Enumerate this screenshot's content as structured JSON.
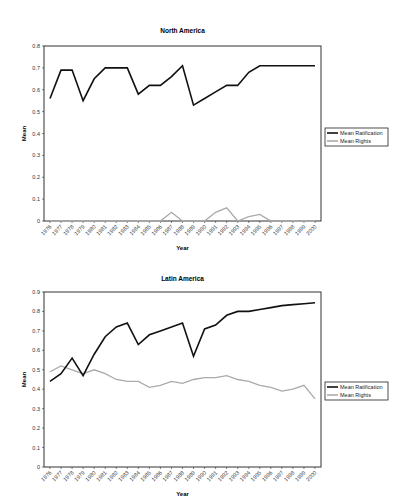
{
  "chart_data": [
    {
      "type": "line",
      "title": "North America",
      "xlabel": "Year",
      "ylabel": "Mean",
      "ylim": [
        0,
        0.8
      ],
      "yticks": [
        0,
        0.1,
        0.2,
        0.3,
        0.4,
        0.5,
        0.6,
        0.7,
        0.8
      ],
      "grid": false,
      "legend_position": "right",
      "x": [
        "1976",
        "1977",
        "1978",
        "1979",
        "1980",
        "1981",
        "1982",
        "1983",
        "1984",
        "1985",
        "1986",
        "1987",
        "1988",
        "1989",
        "1990",
        "1991",
        "1992",
        "1993",
        "1994",
        "1995",
        "1996",
        "1997",
        "1998",
        "1999",
        "2000"
      ],
      "series": [
        {
          "name": "Mean Ratification",
          "color": "#111111",
          "values": [
            0.56,
            0.69,
            0.69,
            0.55,
            0.65,
            0.7,
            0.7,
            0.7,
            0.58,
            0.62,
            0.62,
            0.66,
            0.71,
            0.53,
            0.56,
            0.59,
            0.62,
            0.62,
            0.68,
            0.71,
            0.71,
            0.71,
            0.71,
            0.71,
            0.71
          ]
        },
        {
          "name": "Mean Rights",
          "color": "#aaaaaa",
          "values": [
            0,
            0,
            0,
            0,
            0,
            0,
            0,
            0,
            0,
            0,
            0,
            0.04,
            0,
            0,
            0,
            0.04,
            0.06,
            0,
            0.02,
            0.03,
            0,
            0,
            0,
            0,
            0
          ]
        }
      ]
    },
    {
      "type": "line",
      "title": "Latin America",
      "xlabel": "Year",
      "ylabel": "Mean",
      "ylim": [
        0,
        0.9
      ],
      "yticks": [
        0,
        0.1,
        0.2,
        0.3,
        0.4,
        0.5,
        0.6,
        0.7,
        0.8,
        0.9
      ],
      "grid": false,
      "legend_position": "right",
      "x": [
        "1976",
        "1977",
        "1978",
        "1979",
        "1980",
        "1981",
        "1982",
        "1983",
        "1984",
        "1985",
        "1986",
        "1987",
        "1988",
        "1989",
        "1990",
        "1991",
        "1992",
        "1993",
        "1994",
        "1995",
        "1996",
        "1997",
        "1998",
        "1999",
        "2000"
      ],
      "series": [
        {
          "name": "Mean Ratification",
          "color": "#111111",
          "values": [
            0.44,
            0.48,
            0.56,
            0.47,
            0.58,
            0.67,
            0.72,
            0.74,
            0.63,
            0.68,
            0.7,
            0.72,
            0.74,
            0.57,
            0.71,
            0.73,
            0.78,
            0.8,
            0.8,
            0.81,
            0.82,
            0.83,
            0.835,
            0.84,
            0.845
          ]
        },
        {
          "name": "Mean Rights",
          "color": "#aaaaaa",
          "values": [
            0.49,
            0.52,
            0.5,
            0.48,
            0.5,
            0.48,
            0.45,
            0.44,
            0.44,
            0.41,
            0.42,
            0.44,
            0.43,
            0.45,
            0.46,
            0.46,
            0.47,
            0.45,
            0.44,
            0.42,
            0.41,
            0.39,
            0.4,
            0.42,
            0.35
          ]
        }
      ]
    }
  ]
}
